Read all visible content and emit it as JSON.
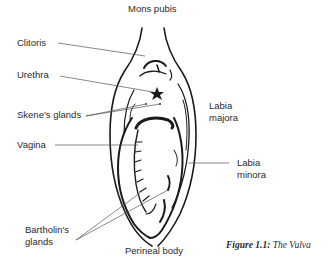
{
  "figure": {
    "caption_prefix": "Figure 1.1:",
    "caption_title": "The Vulva"
  },
  "labels": {
    "mons_pubis": "Mons pubis",
    "clitoris": "Clitoris",
    "urethra": "Urethra",
    "skenes_glands": "Skene's glands",
    "vagina": "Vagina",
    "labia_majora_1": "Labia",
    "labia_majora_2": "majora",
    "labia_minora_1": "Labia",
    "labia_minora_2": "minora",
    "bartholins_1": "Bartholin's",
    "bartholins_2": "glands",
    "perineal_body": "Perineal body"
  },
  "colors": {
    "ink": "#1a1a1a",
    "leader": "#555555",
    "background": "#ffffff"
  }
}
